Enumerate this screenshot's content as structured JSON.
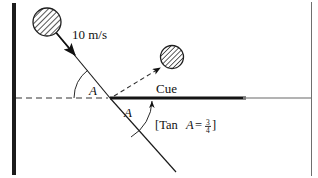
{
  "figure": {
    "labels": {
      "speed": "10 m/s",
      "cue": "Cue",
      "angle_upper": "A",
      "angle_lower": "A",
      "formula_open": "[Tan",
      "formula_var": "A",
      "formula_eq": "=",
      "formula_numerator": "3",
      "formula_denominator": "4",
      "formula_close": "]"
    },
    "colors": {
      "ink": "#111111",
      "line": "#1a1a1a",
      "wall": "#1c1c1c",
      "cue_dark": "#141414",
      "cue_light": "#8f8f8f",
      "ball_fill": "#ffffff",
      "ball_hatch": "#2b2b2b",
      "dashed": "#333333"
    },
    "geometry": {
      "wall": {
        "x": 13,
        "y_top": 3,
        "y_bottom": 175,
        "width": 4
      },
      "dashed_axis": {
        "x1": 14,
        "y1": 98,
        "x2": 110,
        "y2": 98
      },
      "cue_line_dark": {
        "x1": 110,
        "y1": 98,
        "x2": 246,
        "y2": 98
      },
      "cue_line_light": {
        "x1": 246,
        "y1": 98,
        "x2": 311,
        "y2": 98
      },
      "incoming_path": {
        "x1": 52,
        "y1": 28,
        "x2": 110,
        "y2": 98
      },
      "outgoing_path": {
        "x1": 110,
        "y1": 98,
        "x2": 176,
        "y2": 172
      },
      "dashed_arrow": {
        "x1": 113,
        "y1": 96,
        "x2": 162,
        "y2": 66
      },
      "ball_incoming": {
        "cx": 47,
        "cy": 22,
        "r": 14
      },
      "ball_outgoing": {
        "cx": 172,
        "cy": 57,
        "r": 11
      },
      "intersection": {
        "x": 110,
        "y": 98
      },
      "right_border": {
        "x": 311,
        "y_top": 3,
        "y_bottom": 175
      }
    }
  }
}
